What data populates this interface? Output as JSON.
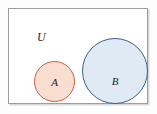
{
  "figure": {
    "type": "venn-diagram",
    "universe": {
      "label": "U",
      "border_color": "#9d9d9d",
      "fill_color": "#ffffff",
      "shadow_color": "#d9d9d9"
    },
    "sets": [
      {
        "id": "A",
        "label": "A",
        "fill_color": "#f7ded0",
        "stroke_color": "#cf5c43",
        "diameter": 41
      },
      {
        "id": "B",
        "label": "B",
        "fill_color": "#dfeaf4",
        "stroke_color": "#3c5f86",
        "diameter": 66
      }
    ]
  },
  "chart_data": {
    "type": "diagram",
    "title": "",
    "subtype": "venn",
    "universe_label": "U",
    "regions": [
      {
        "name": "A",
        "label": "A",
        "overlap_with": [],
        "fill": "#f7ded0",
        "stroke": "#cf5c43"
      },
      {
        "name": "B",
        "label": "B",
        "overlap_with": [],
        "fill": "#dfeaf4",
        "stroke": "#3c5f86"
      }
    ],
    "intersections": []
  }
}
